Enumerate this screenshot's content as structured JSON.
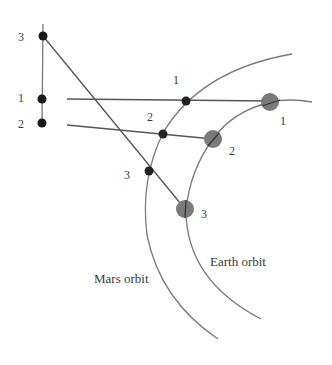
{
  "diagram": {
    "type": "retrograde-motion-geometry",
    "colors": {
      "line": "#555555",
      "orbit": "#777777",
      "mars_dot": "#222222",
      "earth_dot": "#7a7a7a",
      "sky_dot": "#1a1a1a",
      "text": "#3a3a3a"
    },
    "orbits": {
      "mars": {
        "label": "Mars orbit"
      },
      "earth": {
        "label": "Earth orbit"
      }
    },
    "positions": [
      {
        "id": "1",
        "sky_label": "1",
        "mars_label": "1",
        "earth_label": "1"
      },
      {
        "id": "2",
        "sky_label": "2",
        "mars_label": "2",
        "earth_label": "2"
      },
      {
        "id": "3",
        "sky_label": "3",
        "mars_label": "3",
        "earth_label": "3"
      }
    ]
  }
}
